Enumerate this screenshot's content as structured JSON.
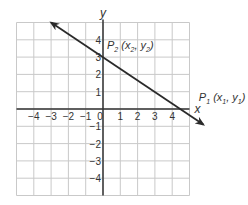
{
  "chart_data": {
    "type": "line",
    "title": "",
    "xlabel": "x",
    "ylabel": "y",
    "xlim": [
      -5,
      5
    ],
    "ylim": [
      -5,
      5
    ],
    "grid": true,
    "x_ticks": [
      -4,
      -3,
      -2,
      -1,
      0,
      1,
      2,
      3,
      4
    ],
    "y_ticks": [
      4,
      3,
      2,
      1,
      -1,
      -2,
      -3,
      -4
    ],
    "x_tick_labels": [
      "−4",
      "−3",
      "−2",
      "−1",
      "0",
      "1",
      "2",
      "3",
      "4"
    ],
    "y_tick_labels": [
      "4",
      "3",
      "2",
      "1",
      "−1",
      "−2",
      "−3",
      "−4"
    ],
    "series": [
      {
        "name": "line",
        "x": [
          -3,
          5.8
        ],
        "y": [
          5,
          -0.9
        ],
        "arrows": "both"
      }
    ],
    "points": [
      {
        "name": "P2",
        "label": "P",
        "sub": "2",
        "coord_text": "(x",
        "coord_sub1": "2",
        "coord_mid": ", y",
        "coord_sub2": "2",
        "coord_end": ")",
        "x": 0,
        "y": 3
      },
      {
        "name": "P1",
        "label": "P",
        "sub": "1",
        "coord_text": "(x",
        "coord_sub1": "1",
        "coord_mid": ", y",
        "coord_sub2": "1",
        "coord_end": ")",
        "x": 4.5,
        "y": 0
      }
    ]
  }
}
